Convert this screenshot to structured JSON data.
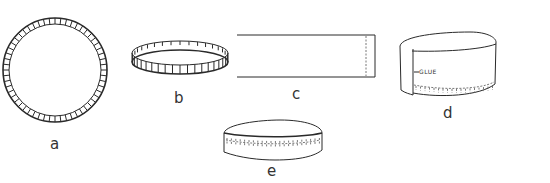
{
  "figure": {
    "panels": [
      {
        "id": "a",
        "label": "a",
        "shape": "serrated-circle",
        "description": "Circle with notched edge tabs"
      },
      {
        "id": "b",
        "label": "b",
        "shape": "notched-ring",
        "description": "Tabs folded up forming a ring"
      },
      {
        "id": "c",
        "label": "c",
        "shape": "paper-strip",
        "description": "Rectangular strip with dashed overlap line"
      },
      {
        "id": "d",
        "label": "d",
        "shape": "cylinder-band",
        "description": "Strip wrapped around tabs and glued",
        "annotation": "GLUE"
      },
      {
        "id": "e",
        "label": "e",
        "shape": "flat-cylinder",
        "description": "Finished shallow lid"
      }
    ]
  },
  "colors": {
    "ink": "#2a2a2a",
    "background": "#ffffff"
  }
}
